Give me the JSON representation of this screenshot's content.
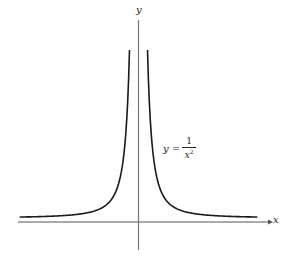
{
  "chart_data": {
    "type": "line",
    "title": "",
    "xlabel": "x",
    "ylabel": "y",
    "annotations": [
      {
        "text": "y = 1/x^2",
        "position": "right of positive branch, mid-height"
      }
    ],
    "series": [
      {
        "name": "y = 1/x^2 (left branch)",
        "function": "1/x^2",
        "x_range": [
          -3.3,
          -0.25
        ]
      },
      {
        "name": "y = 1/x^2 (right branch)",
        "function": "1/x^2",
        "x_range": [
          0.25,
          3.3
        ]
      }
    ],
    "xlim": [
      -3.6,
      3.9
    ],
    "ylim": [
      -1.0,
      16
    ],
    "grid": false,
    "legend": "none",
    "ticks": "none"
  },
  "labels": {
    "x_axis": "x",
    "y_axis": "y",
    "equation_lhs": "y =",
    "equation_num": "1",
    "equation_den": "x",
    "equation_exp": "2"
  },
  "colors": {
    "curve": "#1a1a1a",
    "axis": "#555555",
    "background": "#ffffff"
  }
}
